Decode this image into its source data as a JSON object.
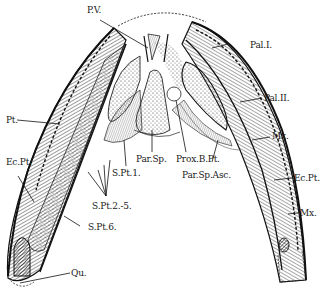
{
  "figure": {
    "type": "anatomical diagram",
    "colors": {
      "ink": "#1a1a1a",
      "background": "#ffffff"
    }
  },
  "labels": {
    "pv": "P.V.",
    "pal1": "Pal.I.",
    "pal2": "Pal.II.",
    "pt": "Pt.",
    "mx_upper": "Mx.",
    "ecpt_left": "Ec.Pt.",
    "ecpt_right": "Ec.Pt.",
    "mx_lower": "Mx.",
    "par_sp": "Par.Sp.",
    "prox_bpt": "Prox.B.Pt.",
    "par_sp_asc": "Par.Sp.Asc.",
    "spt1": "S.Pt.1.",
    "spt2_5": "S.Pt.2.-5.",
    "spt6": "S.Pt.6.",
    "qu": "Qu."
  }
}
